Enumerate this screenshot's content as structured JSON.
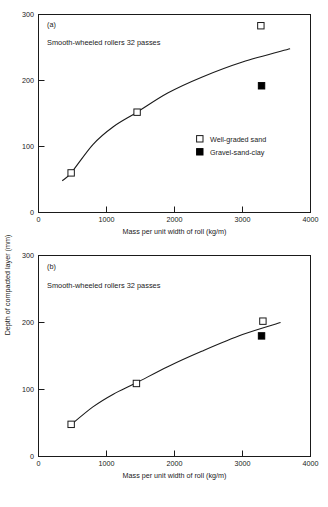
{
  "figure": {
    "background": "#ffffff",
    "ink_color": "#1a1a1a",
    "ylabel": "Depth of compacted layer (mm)"
  },
  "chart_data": [
    {
      "type": "scatter",
      "panel": "(a)",
      "title": "",
      "annotation": "Smooth-wheeled rollers  32 passes",
      "xlabel": "Mass per unit width of roll (kg/m)",
      "ylabel": "Depth of compacted layer (mm)",
      "xlim": [
        0,
        4000
      ],
      "ylim": [
        0,
        300
      ],
      "xticks": [
        0,
        1000,
        2000,
        3000,
        4000
      ],
      "yticks": [
        0,
        100,
        200,
        300
      ],
      "xtick_labels": [
        "0",
        "1000",
        "2000",
        "3000",
        "4000"
      ],
      "ytick_labels": [
        "0",
        "100",
        "200",
        "300"
      ],
      "grid": false,
      "legend_position": "inside-right",
      "series": [
        {
          "name": "Well-graded sand",
          "marker": "open-square",
          "points": [
            {
              "x": 480,
              "y": 60
            },
            {
              "x": 1450,
              "y": 152
            },
            {
              "x": 3270,
              "y": 283
            }
          ]
        },
        {
          "name": "Gravel-sand-clay",
          "marker": "filled-square",
          "points": [
            {
              "x": 3280,
              "y": 192
            }
          ]
        },
        {
          "name": "fitted-curve",
          "marker": "none",
          "points": [
            {
              "x": 350,
              "y": 48
            },
            {
              "x": 480,
              "y": 60
            },
            {
              "x": 800,
              "y": 103
            },
            {
              "x": 1100,
              "y": 130
            },
            {
              "x": 1450,
              "y": 152
            },
            {
              "x": 1900,
              "y": 181
            },
            {
              "x": 2400,
              "y": 205
            },
            {
              "x": 3000,
              "y": 228
            },
            {
              "x": 3700,
              "y": 248
            }
          ]
        }
      ]
    },
    {
      "type": "scatter",
      "panel": "(b)",
      "title": "",
      "annotation": "Smooth-wheeled rollers  32 passes",
      "xlabel": "Mass per unit width of roll (kg/m)",
      "ylabel": "Depth of compacted layer (mm)",
      "xlim": [
        0,
        4000
      ],
      "ylim": [
        0,
        300
      ],
      "xticks": [
        0,
        1000,
        2000,
        3000,
        4000
      ],
      "yticks": [
        0,
        100,
        200,
        300
      ],
      "xtick_labels": [
        "0",
        "1000",
        "2000",
        "3000",
        "4000"
      ],
      "ytick_labels": [
        "0",
        "100",
        "200",
        "300"
      ],
      "grid": false,
      "legend_position": "none",
      "series": [
        {
          "name": "Well-graded sand",
          "marker": "open-square",
          "points": [
            {
              "x": 480,
              "y": 48
            },
            {
              "x": 1440,
              "y": 109
            },
            {
              "x": 3300,
              "y": 202
            }
          ]
        },
        {
          "name": "Gravel-sand-clay",
          "marker": "filled-square",
          "points": [
            {
              "x": 3280,
              "y": 180
            }
          ]
        },
        {
          "name": "fitted-curve",
          "marker": "none",
          "points": [
            {
              "x": 450,
              "y": 45
            },
            {
              "x": 800,
              "y": 74
            },
            {
              "x": 1100,
              "y": 93
            },
            {
              "x": 1440,
              "y": 110
            },
            {
              "x": 1900,
              "y": 134
            },
            {
              "x": 2400,
              "y": 157
            },
            {
              "x": 3000,
              "y": 182
            },
            {
              "x": 3560,
              "y": 200
            }
          ]
        }
      ]
    }
  ],
  "legend": {
    "entries": [
      {
        "label": "Well-graded sand",
        "marker": "open-square"
      },
      {
        "label": "Gravel-sand-clay",
        "marker": "filled-square"
      }
    ]
  }
}
